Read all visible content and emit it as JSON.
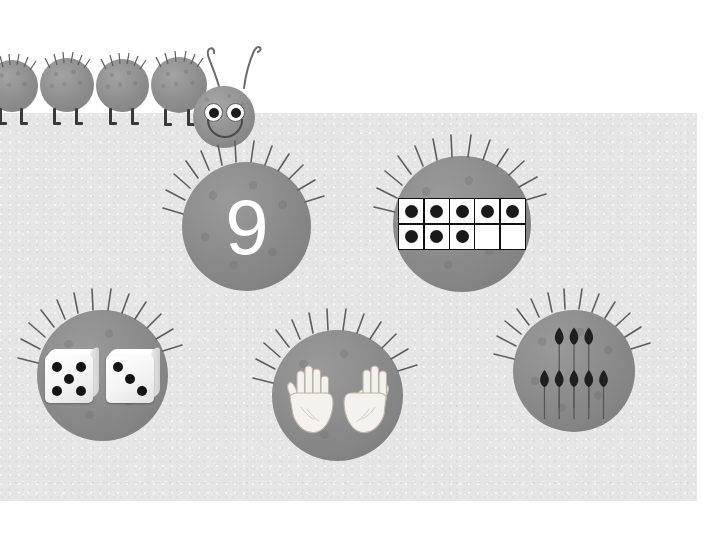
{
  "page": {
    "title": "Number 9 representations worksheet",
    "background_color": "#ffffff",
    "panel_color": "#e6e6e6",
    "ball_color": "#8b8b8b",
    "accent_color": "#ffffff"
  },
  "mascot": {
    "name": "caterpillar",
    "segment_count": 4,
    "has_head": true,
    "eyes": 2,
    "antennae": 2,
    "expression": "smiling",
    "body_color": "#8e8e8e",
    "leg_color": "#3a3a3a"
  },
  "cards": [
    {
      "id": "numeral-ball",
      "name": "numeral-card",
      "representation": "numeral",
      "value": "9",
      "label": "9"
    },
    {
      "id": "tenframe-ball",
      "name": "ten-frame-card",
      "representation": "ten-frame",
      "rows": 2,
      "columns": 5,
      "filled_top": 5,
      "filled_bottom": 3,
      "total_filled": 8,
      "dot_color": "#1a1a1a",
      "cell_color": "#ffffff"
    },
    {
      "id": "dice-ball",
      "name": "dice-card",
      "representation": "dice",
      "dice": [
        5,
        3
      ],
      "total": 8,
      "pip_color": "#141414"
    },
    {
      "id": "hands-ball",
      "name": "hands-card",
      "representation": "fingers",
      "left_hand_fingers": 5,
      "right_hand_fingers": 3,
      "total": 8,
      "hand_color": "#f2f0ea"
    },
    {
      "id": "pins-ball",
      "name": "pins-card",
      "representation": "pins",
      "top_row": 3,
      "bottom_row": 5,
      "total": 8,
      "pin_color": "#1f1f1f"
    }
  ]
}
